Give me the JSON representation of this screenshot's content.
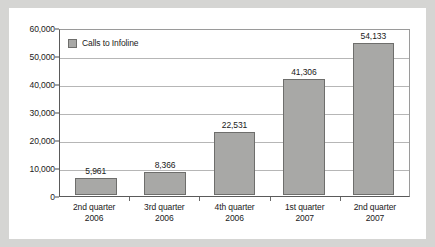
{
  "chart_data": {
    "type": "bar",
    "title": "",
    "subtitle": "",
    "xlabel": "",
    "ylabel": "",
    "categories": [
      "2nd quarter\n2006",
      "3rd quarter\n2006",
      "4th quarter\n2006",
      "1st quarter\n2007",
      "2nd quarter\n2007"
    ],
    "category_lines": [
      {
        "line1": "2nd quarter",
        "line2": "2006"
      },
      {
        "line1": "3rd quarter",
        "line2": "2006"
      },
      {
        "line1": "4th quarter",
        "line2": "2006"
      },
      {
        "line1": "1st quarter",
        "line2": "2007"
      },
      {
        "line1": "2nd quarter",
        "line2": "2007"
      }
    ],
    "series": [
      {
        "name": "Calls to Infoline",
        "values": [
          5961,
          8366,
          22531,
          41306,
          54133
        ],
        "value_labels": [
          "5,961",
          "8,366",
          "22,531",
          "41,306",
          "54,133"
        ],
        "color": "#a8a8a6"
      }
    ],
    "ylim": [
      0,
      60000
    ],
    "ytick_values": [
      0,
      10000,
      20000,
      30000,
      40000,
      50000,
      60000
    ],
    "ytick_labels": [
      "0",
      "10,000",
      "20,000",
      "30,000",
      "40,000",
      "50,000",
      "60,000"
    ],
    "grid": true,
    "grid_color": "#b6b6b6",
    "legend_position": "top-left",
    "legend": [
      {
        "label": "Calls to Infoline",
        "color": "#a8a8a6"
      }
    ],
    "axis_color": "#5a5a5a",
    "background": "#ffffff",
    "page_background": "#d5d5d3"
  }
}
